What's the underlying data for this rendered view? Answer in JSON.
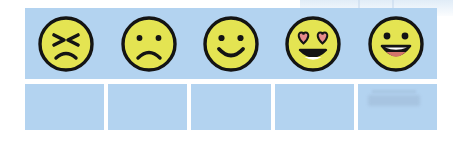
{
  "worksheet": {
    "title": "Emotion faces rating strip",
    "panel_color": "#b3d3f0",
    "face_fill": "#e4e452",
    "face_outline": "#141414",
    "heart_color": "#e58b8b",
    "tongue_color": "#d4756b",
    "teeth_color": "#ffffff",
    "background": "#ffffff"
  },
  "faces_row": {
    "label": "Emoji faces header row",
    "faces": [
      {
        "id": "face-1",
        "icon": "angry-face-icon",
        "label": "Angry face",
        "expression": "angry",
        "eyes": "angled-slanted",
        "mouth": "frown"
      },
      {
        "id": "face-2",
        "icon": "sad-face-icon",
        "label": "Sad face",
        "expression": "sad",
        "eyes": "dots",
        "mouth": "frown"
      },
      {
        "id": "face-3",
        "icon": "smiling-face-icon",
        "label": "Smiling face",
        "expression": "happy",
        "eyes": "dots",
        "mouth": "smile"
      },
      {
        "id": "face-4",
        "icon": "heart-eyes-face-icon",
        "label": "Heart eyes face",
        "expression": "in-love",
        "eyes": "hearts",
        "mouth": "grin-with-teeth"
      },
      {
        "id": "face-5",
        "icon": "laughing-face-icon",
        "label": "Laughing face",
        "expression": "very-happy",
        "eyes": "dots",
        "mouth": "open-with-tongue"
      }
    ]
  },
  "answer_row": {
    "label": "Blank answer boxes row",
    "cells": [
      {
        "id": "answer-box-1",
        "value": ""
      },
      {
        "id": "answer-box-2",
        "value": ""
      },
      {
        "id": "answer-box-3",
        "value": ""
      },
      {
        "id": "answer-box-4",
        "value": ""
      },
      {
        "id": "answer-box-5",
        "value": ""
      }
    ]
  }
}
